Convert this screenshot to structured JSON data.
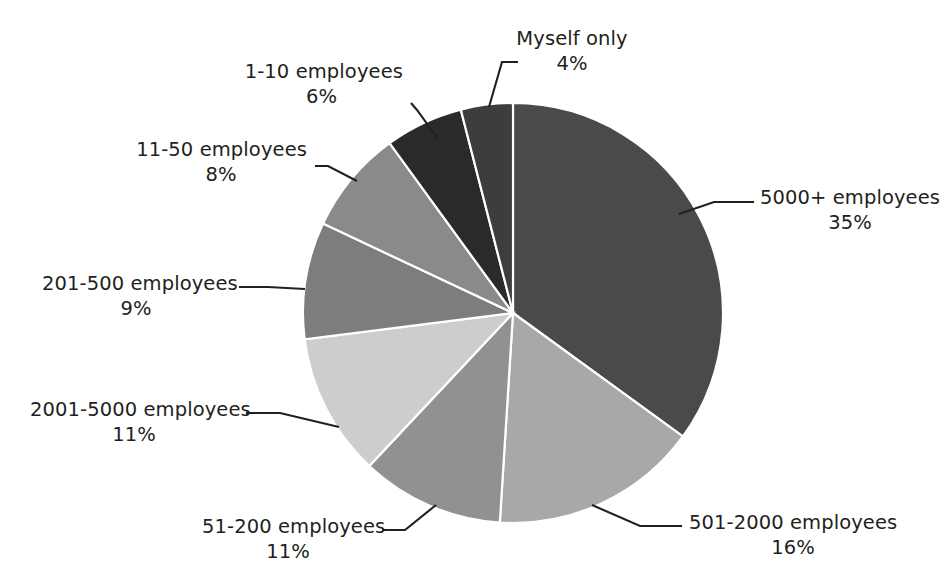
{
  "chart_data": {
    "type": "pie",
    "title": "",
    "subtitle": "",
    "xlabel": "",
    "ylabel": "",
    "legend_position": "none",
    "grid": false,
    "labels_show_percent": true,
    "start_angle_deg": 0,
    "direction": "clockwise",
    "categories": [
      "5000+ employees",
      "501-2000 employees",
      "51-200 employees",
      "2001-5000 employees",
      "201-500 employees",
      "11-50 employees",
      "1-10 employees",
      "Myself only"
    ],
    "values": [
      35,
      16,
      11,
      11,
      9,
      8,
      6,
      4
    ],
    "value_labels": [
      "35%",
      "16%",
      "11%",
      "11%",
      "9%",
      "8%",
      "6%",
      "4%"
    ],
    "colors": [
      "#4a4a4a",
      "#a8a8a8",
      "#919191",
      "#cdcdcd",
      "#7d7d7d",
      "#8a8a8a",
      "#2a2a2a",
      "#3d3d3d"
    ],
    "slice_separator_color": "#ffffff",
    "label_text_color": "#231f20",
    "leader_line_color": "#231f20",
    "background_color": "#ffffff"
  },
  "slices": [
    {
      "name": "5000+ employees",
      "percent_label": "35%",
      "value": 35,
      "color": "#4a4a4a"
    },
    {
      "name": "501-2000 employees",
      "percent_label": "16%",
      "value": 16,
      "color": "#a8a8a8"
    },
    {
      "name": "51-200 employees",
      "percent_label": "11%",
      "value": 11,
      "color": "#919191"
    },
    {
      "name": "2001-5000 employees",
      "percent_label": "11%",
      "value": 11,
      "color": "#cdcdcd"
    },
    {
      "name": "201-500 employees",
      "percent_label": "9%",
      "value": 9,
      "color": "#7d7d7d"
    },
    {
      "name": "11-50 employees",
      "percent_label": "8%",
      "value": 8,
      "color": "#8a8a8a"
    },
    {
      "name": "1-10 employees",
      "percent_label": "6%",
      "value": 6,
      "color": "#2a2a2a"
    },
    {
      "name": "Myself only",
      "percent_label": "4%",
      "value": 4,
      "color": "#3d3d3d"
    }
  ]
}
